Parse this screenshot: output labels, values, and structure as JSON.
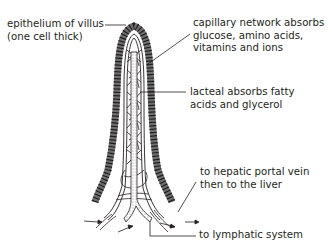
{
  "diagram": {
    "subject": "villus",
    "labels": {
      "epithelium_line1": "epithelium of villus",
      "epithelium_line2": "(one cell thick)",
      "capillary_line1": "capillary network absorbs",
      "capillary_line2": "glucose, amino acids,",
      "capillary_line3": "vitamins and ions",
      "lacteal_line1": "lacteal absorbs fatty",
      "lacteal_line2": "acids and glycerol",
      "hepatic_line1": "to hepatic portal vein",
      "hepatic_line2": "then to the liver",
      "lymphatic": "to lymphatic system"
    },
    "colors": {
      "ink": "#231f20",
      "epithelium_fill": "#8a8a8a",
      "lacteal_stipple": "#bdbdbd",
      "background": "#ffffff"
    }
  }
}
